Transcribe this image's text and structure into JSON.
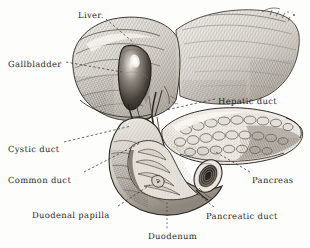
{
  "figure": {
    "style": "vintage pen-and-ink engraving",
    "background_color": "#fdfdfc",
    "ink_color": "#2a2724",
    "width": 310,
    "height": 248
  },
  "labels": [
    {
      "id": "liver",
      "text": "Liver.",
      "x": 78,
      "y": 11,
      "leader": {
        "type": "dashed",
        "from": [
          106,
          19
        ],
        "to": [
          134,
          43
        ]
      }
    },
    {
      "id": "gallbladder",
      "text": "Gallbladder",
      "x": 8,
      "y": 60,
      "leader": {
        "type": "dashed",
        "from": [
          66,
          64
        ],
        "to": [
          122,
          73
        ]
      }
    },
    {
      "id": "hepatic-duct",
      "text": "Hepatic duct",
      "x": 218,
      "y": 97,
      "leader": {
        "type": "dashed",
        "from": [
          215,
          101
        ],
        "to": [
          166,
          110
        ]
      }
    },
    {
      "id": "cystic-duct",
      "text": "Cystic duct",
      "x": 8,
      "y": 145,
      "leader": {
        "type": "dashed",
        "from": [
          64,
          144
        ],
        "to": [
          132,
          126
        ]
      }
    },
    {
      "id": "common-duct",
      "text": "Common duct",
      "x": 8,
      "y": 176,
      "leader": {
        "type": "dashed",
        "from": [
          82,
          174
        ],
        "to": [
          139,
          143
        ]
      }
    },
    {
      "id": "duodenal-papilla",
      "text": "Duodenal papilla",
      "x": 32,
      "y": 211,
      "leader": {
        "type": "dashed",
        "from": [
          116,
          208
        ],
        "to": [
          148,
          186
        ]
      }
    },
    {
      "id": "pancreas",
      "text": "Pancreas",
      "x": 252,
      "y": 176,
      "leader": {
        "type": "dashed",
        "from": [
          250,
          174
        ],
        "to": [
          214,
          152
        ]
      }
    },
    {
      "id": "pancreatic-duct",
      "text": "Pancreatic duct",
      "x": 206,
      "y": 212,
      "leader": {
        "type": "dashed",
        "from": [
          212,
          209
        ],
        "to": [
          196,
          196
        ]
      }
    },
    {
      "id": "duodenum",
      "text": "Duodenum",
      "x": 148,
      "y": 232,
      "leader": {
        "type": "dotted",
        "from": [
          166,
          229
        ],
        "to": [
          166,
          202
        ]
      }
    }
  ],
  "structures": [
    {
      "id": "liver",
      "name": "Liver",
      "region": "upper-left and upper-right lobes"
    },
    {
      "id": "gallbladder",
      "name": "Gallbladder",
      "region": "pear-shaped sac on liver undersurface"
    },
    {
      "id": "hepatic-duct",
      "name": "Hepatic duct",
      "region": "porta hepatis"
    },
    {
      "id": "cystic-duct",
      "name": "Cystic duct",
      "region": "gallbladder neck"
    },
    {
      "id": "common-duct",
      "name": "Common bile duct",
      "region": "descends to duodenum"
    },
    {
      "id": "duodenal-papilla",
      "name": "Duodenal papilla",
      "region": "duodenal inner wall"
    },
    {
      "id": "duodenum",
      "name": "Duodenum",
      "region": "C-loop, opened anteriorly"
    },
    {
      "id": "pancreas",
      "name": "Pancreas",
      "region": "body and tail to the right"
    },
    {
      "id": "pancreatic-duct",
      "name": "Pancreatic duct",
      "region": "cut end, lower right"
    }
  ]
}
